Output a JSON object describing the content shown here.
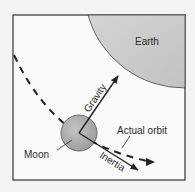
{
  "diagram": {
    "labels": {
      "earth": "Earth",
      "gravity": "Gravity",
      "inertia": "Inertia",
      "moon": "Moon",
      "actual_orbit": "Actual orbit"
    },
    "colors": {
      "background": "#f4f4f4",
      "border": "#333333",
      "earth_fill": "#c8c8c8",
      "moon_fill": "#a8a8a8",
      "line": "#222222"
    }
  }
}
